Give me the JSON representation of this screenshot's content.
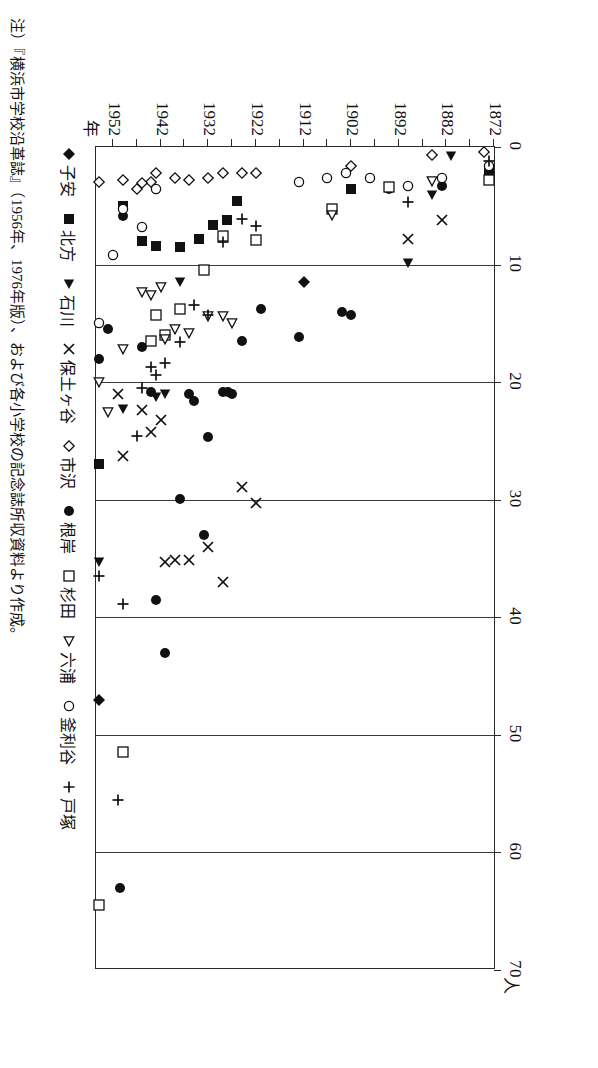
{
  "figure": {
    "orientation": "rotated-90-ccw",
    "value_axis_unit": "人",
    "year_axis_unit": "年",
    "note": "注）『横浜市学校沿革誌』（1956年、1976年版）、および各小学校の記念誌所収資料より作成。"
  },
  "chart_data": {
    "type": "scatter",
    "title": "",
    "xlabel": "年",
    "ylabel": "人",
    "xlim": [
      1872,
      1956
    ],
    "ylim": [
      0,
      70
    ],
    "grid": "value-axis gridlines every 10",
    "value_ticks": [
      "0",
      "10",
      "20",
      "30",
      "40",
      "50",
      "60",
      "70"
    ],
    "value_tick_values": [
      0,
      10,
      20,
      30,
      40,
      50,
      60,
      70
    ],
    "year_ticks": [
      "1872",
      "1882",
      "1892",
      "1902",
      "1912",
      "1922",
      "1932",
      "1942",
      "1952"
    ],
    "year_tick_values": [
      1872,
      1882,
      1892,
      1902,
      1912,
      1922,
      1932,
      1942,
      1952
    ],
    "legend_position": "bottom",
    "series": [
      {
        "name": "子安",
        "marker": "filled-diamond",
        "points": [
          [
            1912,
            11.5
          ],
          [
            1955,
            47.0
          ]
        ]
      },
      {
        "name": "北方",
        "marker": "filled-square",
        "points": [
          [
            1873,
            2.2
          ],
          [
            1902,
            3.6
          ],
          [
            1926,
            4.6
          ],
          [
            1928,
            6.2
          ],
          [
            1931,
            6.6
          ],
          [
            1934,
            7.8
          ],
          [
            1938,
            8.5
          ],
          [
            1943,
            8.4
          ],
          [
            1946,
            8.0
          ],
          [
            1950,
            5.0
          ],
          [
            1955,
            27.0
          ]
        ]
      },
      {
        "name": "石川",
        "marker": "filled-right-triangle",
        "points": [
          [
            1881,
            0.8
          ],
          [
            1885,
            4.1
          ],
          [
            1890,
            9.9
          ],
          [
            1938,
            11.5
          ],
          [
            1941,
            21.0
          ],
          [
            1943,
            21.3
          ],
          [
            1950,
            22.3
          ],
          [
            1955,
            35.3
          ]
        ]
      },
      {
        "name": "保土ヶ谷",
        "marker": "cross-x",
        "points": [
          [
            1883,
            6.2
          ],
          [
            1890,
            7.8
          ],
          [
            1922,
            30.3
          ],
          [
            1925,
            28.9
          ],
          [
            1929,
            37.0
          ],
          [
            1932,
            34.0
          ],
          [
            1936,
            35.1
          ],
          [
            1939,
            35.1
          ],
          [
            1941,
            35.3
          ],
          [
            1942,
            23.2
          ],
          [
            1944,
            24.2
          ],
          [
            1946,
            22.4
          ],
          [
            1950,
            26.3
          ],
          [
            1951,
            21.0
          ]
        ]
      },
      {
        "name": "市沢",
        "marker": "open-diamond",
        "points": [
          [
            1874,
            0.4
          ],
          [
            1885,
            0.7
          ],
          [
            1902,
            1.6
          ],
          [
            1922,
            2.2
          ],
          [
            1925,
            2.2
          ],
          [
            1929,
            2.2
          ],
          [
            1932,
            2.6
          ],
          [
            1936,
            2.8
          ],
          [
            1939,
            2.6
          ],
          [
            1943,
            2.2
          ],
          [
            1944,
            3.0
          ],
          [
            1946,
            3.1
          ],
          [
            1947,
            3.6
          ],
          [
            1950,
            2.8
          ],
          [
            1955,
            3.0
          ]
        ]
      },
      {
        "name": "根岸",
        "marker": "filled-circle",
        "points": [
          [
            1873,
            1.6
          ],
          [
            1883,
            3.3
          ],
          [
            1894,
            3.6
          ],
          [
            1902,
            14.3
          ],
          [
            1904,
            14.0
          ],
          [
            1913,
            16.2
          ],
          [
            1921,
            13.8
          ],
          [
            1925,
            16.5
          ],
          [
            1927,
            21.0
          ],
          [
            1927.8,
            20.8
          ],
          [
            1929,
            20.8
          ],
          [
            1932,
            24.7
          ],
          [
            1933,
            33.0
          ],
          [
            1935,
            21.6
          ],
          [
            1936,
            21.0
          ],
          [
            1938,
            29.9
          ],
          [
            1941,
            43.0
          ],
          [
            1943,
            38.5
          ],
          [
            1944,
            20.8
          ],
          [
            1946,
            17.0
          ],
          [
            1950,
            5.9
          ],
          [
            1950.5,
            63.0
          ],
          [
            1953,
            15.5
          ],
          [
            1955,
            18.0
          ]
        ]
      },
      {
        "name": "杉田",
        "marker": "open-square",
        "points": [
          [
            1873,
            2.8
          ],
          [
            1894,
            3.4
          ],
          [
            1906,
            5.3
          ],
          [
            1922,
            7.9
          ],
          [
            1929,
            7.6
          ],
          [
            1933,
            10.5
          ],
          [
            1938,
            13.8
          ],
          [
            1941,
            16.0
          ],
          [
            1943,
            14.3
          ],
          [
            1944,
            16.5
          ],
          [
            1950,
            51.5
          ],
          [
            1955,
            64.5
          ]
        ]
      },
      {
        "name": "六浦",
        "marker": "open-right-triangle",
        "points": [
          [
            1885,
            2.9
          ],
          [
            1906,
            5.8
          ],
          [
            1927,
            15.0
          ],
          [
            1929,
            14.4
          ],
          [
            1932,
            14.4
          ],
          [
            1936,
            15.8
          ],
          [
            1939,
            15.5
          ],
          [
            1941,
            16.3
          ],
          [
            1942,
            11.9
          ],
          [
            1944,
            12.6
          ],
          [
            1946,
            12.3
          ],
          [
            1950,
            17.2
          ],
          [
            1953,
            22.5
          ],
          [
            1955,
            20.0
          ]
        ]
      },
      {
        "name": "釜利谷",
        "marker": "open-circle",
        "points": [
          [
            1873,
            1.6
          ],
          [
            1883,
            2.6
          ],
          [
            1890,
            3.3
          ],
          [
            1898,
            2.6
          ],
          [
            1903,
            2.2
          ],
          [
            1907,
            2.6
          ],
          [
            1913,
            3.0
          ],
          [
            1943,
            3.6
          ],
          [
            1946,
            6.8
          ],
          [
            1950,
            5.3
          ],
          [
            1952,
            9.2
          ],
          [
            1955,
            15.0
          ]
        ]
      },
      {
        "name": "戸塚",
        "marker": "plus",
        "points": [
          [
            1873,
            1.2
          ],
          [
            1890,
            4.7
          ],
          [
            1922,
            6.7
          ],
          [
            1925,
            6.1
          ],
          [
            1929,
            8.1
          ],
          [
            1932,
            14.3
          ],
          [
            1935,
            13.4
          ],
          [
            1938,
            16.6
          ],
          [
            1941,
            18.4
          ],
          [
            1943,
            19.4
          ],
          [
            1944,
            18.7
          ],
          [
            1946,
            20.5
          ],
          [
            1947,
            24.6
          ],
          [
            1950,
            38.9
          ],
          [
            1951,
            55.5
          ],
          [
            1955,
            36.5
          ]
        ]
      }
    ]
  },
  "legend": {
    "items": [
      {
        "label": "子安",
        "marker": "filled-diamond"
      },
      {
        "label": "北方",
        "marker": "filled-square"
      },
      {
        "label": "石川",
        "marker": "filled-right-triangle"
      },
      {
        "label": "保土ヶ谷",
        "marker": "cross-x"
      },
      {
        "label": "市沢",
        "marker": "open-diamond"
      },
      {
        "label": "根岸",
        "marker": "filled-circle"
      },
      {
        "label": "杉田",
        "marker": "open-square"
      },
      {
        "label": "六浦",
        "marker": "open-right-triangle"
      },
      {
        "label": "釜利谷",
        "marker": "open-circle"
      },
      {
        "label": "戸塚",
        "marker": "plus"
      }
    ]
  }
}
